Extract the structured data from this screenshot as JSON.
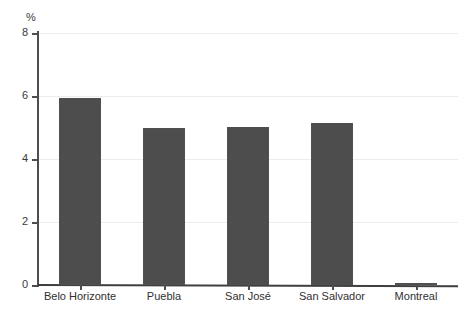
{
  "chart_data": {
    "type": "bar",
    "title": "",
    "subtitle": "",
    "xlabel": "",
    "ylabel": "%",
    "unit_label": "%",
    "categories": [
      "Belo Horizonte",
      "Puebla",
      "San José",
      "San Salvador",
      "Montreal"
    ],
    "values": [
      5.95,
      5.0,
      5.03,
      5.15,
      0.05
    ],
    "series": [
      {
        "name": "",
        "values": [
          5.95,
          5.0,
          5.03,
          5.15,
          0.05
        ]
      }
    ],
    "ylim": [
      0,
      8
    ],
    "ytick_values": [
      0,
      2,
      4,
      6,
      8
    ],
    "ytick_labels": [
      "0",
      "2",
      "4",
      "6",
      "8"
    ],
    "grid": true,
    "grid_axis": "y",
    "legend": false,
    "legend_position": "none",
    "bar_color": "#4d4d4d",
    "gridline_color": "#ececed",
    "axis_color": "#4e4e4e",
    "background_color": "#ffffff"
  },
  "figure": {
    "y_axis_unit": "%"
  }
}
